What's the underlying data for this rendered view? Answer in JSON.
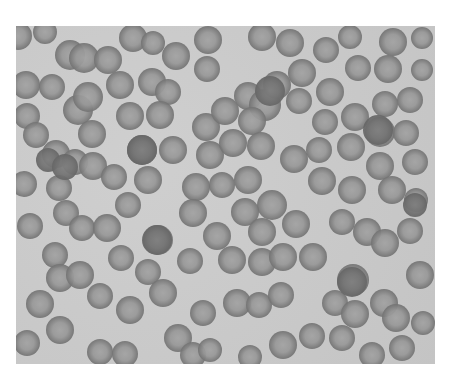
{
  "image": {
    "description": "Light micrograph of a blood smear showing numerous red blood cells (erythrocytes) with pale centers, some overlapping, in grayscale",
    "colors": {
      "background": "#c9c9c9",
      "cell_rim": "#666666",
      "cell_center": "#a3a3a3",
      "page": "#ffffff"
    },
    "bounds": {
      "x": 16,
      "y": 26,
      "width": 419,
      "height": 338
    }
  },
  "cells": [
    {
      "x": 18,
      "y": 36,
      "r": 14
    },
    {
      "x": 45,
      "y": 32,
      "r": 12
    },
    {
      "x": 70,
      "y": 55,
      "r": 15
    },
    {
      "x": 84,
      "y": 58,
      "r": 15
    },
    {
      "x": 108,
      "y": 60,
      "r": 14
    },
    {
      "x": 133,
      "y": 38,
      "r": 14
    },
    {
      "x": 153,
      "y": 43,
      "r": 12
    },
    {
      "x": 176,
      "y": 56,
      "r": 14
    },
    {
      "x": 208,
      "y": 40,
      "r": 14
    },
    {
      "x": 207,
      "y": 69,
      "r": 13
    },
    {
      "x": 262,
      "y": 37,
      "r": 14
    },
    {
      "x": 290,
      "y": 43,
      "r": 14
    },
    {
      "x": 326,
      "y": 50,
      "r": 13
    },
    {
      "x": 350,
      "y": 37,
      "r": 12
    },
    {
      "x": 393,
      "y": 42,
      "r": 14
    },
    {
      "x": 422,
      "y": 38,
      "r": 11
    },
    {
      "x": 26,
      "y": 85,
      "r": 14
    },
    {
      "x": 52,
      "y": 87,
      "r": 13
    },
    {
      "x": 78,
      "y": 110,
      "r": 15
    },
    {
      "x": 88,
      "y": 97,
      "r": 15
    },
    {
      "x": 120,
      "y": 85,
      "r": 14
    },
    {
      "x": 152,
      "y": 82,
      "r": 14
    },
    {
      "x": 168,
      "y": 92,
      "r": 13
    },
    {
      "x": 248,
      "y": 96,
      "r": 14
    },
    {
      "x": 265,
      "y": 105,
      "r": 16
    },
    {
      "x": 277,
      "y": 85,
      "r": 14
    },
    {
      "x": 302,
      "y": 73,
      "r": 14
    },
    {
      "x": 330,
      "y": 92,
      "r": 14
    },
    {
      "x": 358,
      "y": 68,
      "r": 13
    },
    {
      "x": 388,
      "y": 69,
      "r": 14
    },
    {
      "x": 410,
      "y": 100,
      "r": 13
    },
    {
      "x": 422,
      "y": 70,
      "r": 11
    },
    {
      "x": 27,
      "y": 116,
      "r": 13
    },
    {
      "x": 36,
      "y": 135,
      "r": 13
    },
    {
      "x": 92,
      "y": 134,
      "r": 14
    },
    {
      "x": 130,
      "y": 116,
      "r": 14
    },
    {
      "x": 160,
      "y": 115,
      "r": 14
    },
    {
      "x": 206,
      "y": 127,
      "r": 14
    },
    {
      "x": 225,
      "y": 111,
      "r": 14
    },
    {
      "x": 252,
      "y": 121,
      "r": 14
    },
    {
      "x": 299,
      "y": 101,
      "r": 13
    },
    {
      "x": 325,
      "y": 122,
      "r": 13
    },
    {
      "x": 355,
      "y": 117,
      "r": 14
    },
    {
      "x": 385,
      "y": 104,
      "r": 13
    },
    {
      "x": 380,
      "y": 132,
      "r": 15
    },
    {
      "x": 406,
      "y": 133,
      "r": 13
    },
    {
      "x": 56,
      "y": 154,
      "r": 14
    },
    {
      "x": 75,
      "y": 162,
      "r": 13
    },
    {
      "x": 93,
      "y": 166,
      "r": 14
    },
    {
      "x": 142,
      "y": 150,
      "r": 15
    },
    {
      "x": 173,
      "y": 150,
      "r": 14
    },
    {
      "x": 210,
      "y": 155,
      "r": 14
    },
    {
      "x": 233,
      "y": 143,
      "r": 14
    },
    {
      "x": 261,
      "y": 146,
      "r": 14
    },
    {
      "x": 294,
      "y": 159,
      "r": 14
    },
    {
      "x": 319,
      "y": 150,
      "r": 13
    },
    {
      "x": 351,
      "y": 147,
      "r": 14
    },
    {
      "x": 380,
      "y": 166,
      "r": 14
    },
    {
      "x": 415,
      "y": 162,
      "r": 13
    },
    {
      "x": 24,
      "y": 184,
      "r": 13
    },
    {
      "x": 59,
      "y": 188,
      "r": 13
    },
    {
      "x": 114,
      "y": 177,
      "r": 13
    },
    {
      "x": 148,
      "y": 180,
      "r": 14
    },
    {
      "x": 196,
      "y": 187,
      "r": 14
    },
    {
      "x": 222,
      "y": 185,
      "r": 13
    },
    {
      "x": 248,
      "y": 180,
      "r": 14
    },
    {
      "x": 272,
      "y": 205,
      "r": 15
    },
    {
      "x": 322,
      "y": 181,
      "r": 14
    },
    {
      "x": 352,
      "y": 190,
      "r": 14
    },
    {
      "x": 392,
      "y": 190,
      "r": 14
    },
    {
      "x": 416,
      "y": 200,
      "r": 12
    },
    {
      "x": 30,
      "y": 226,
      "r": 13
    },
    {
      "x": 66,
      "y": 213,
      "r": 13
    },
    {
      "x": 82,
      "y": 228,
      "r": 13
    },
    {
      "x": 107,
      "y": 228,
      "r": 14
    },
    {
      "x": 128,
      "y": 205,
      "r": 13
    },
    {
      "x": 158,
      "y": 240,
      "r": 15
    },
    {
      "x": 193,
      "y": 213,
      "r": 14
    },
    {
      "x": 217,
      "y": 236,
      "r": 14
    },
    {
      "x": 245,
      "y": 212,
      "r": 14
    },
    {
      "x": 262,
      "y": 232,
      "r": 14
    },
    {
      "x": 296,
      "y": 224,
      "r": 14
    },
    {
      "x": 342,
      "y": 222,
      "r": 13
    },
    {
      "x": 367,
      "y": 232,
      "r": 14
    },
    {
      "x": 385,
      "y": 243,
      "r": 14
    },
    {
      "x": 410,
      "y": 231,
      "r": 13
    },
    {
      "x": 55,
      "y": 255,
      "r": 13
    },
    {
      "x": 60,
      "y": 278,
      "r": 14
    },
    {
      "x": 80,
      "y": 275,
      "r": 14
    },
    {
      "x": 121,
      "y": 258,
      "r": 13
    },
    {
      "x": 148,
      "y": 272,
      "r": 13
    },
    {
      "x": 190,
      "y": 261,
      "r": 13
    },
    {
      "x": 232,
      "y": 260,
      "r": 14
    },
    {
      "x": 262,
      "y": 262,
      "r": 14
    },
    {
      "x": 283,
      "y": 257,
      "r": 14
    },
    {
      "x": 313,
      "y": 257,
      "r": 14
    },
    {
      "x": 353,
      "y": 280,
      "r": 16
    },
    {
      "x": 420,
      "y": 275,
      "r": 14
    },
    {
      "x": 40,
      "y": 304,
      "r": 14
    },
    {
      "x": 100,
      "y": 296,
      "r": 13
    },
    {
      "x": 130,
      "y": 310,
      "r": 14
    },
    {
      "x": 163,
      "y": 293,
      "r": 14
    },
    {
      "x": 203,
      "y": 313,
      "r": 13
    },
    {
      "x": 237,
      "y": 303,
      "r": 14
    },
    {
      "x": 259,
      "y": 305,
      "r": 13
    },
    {
      "x": 281,
      "y": 295,
      "r": 13
    },
    {
      "x": 335,
      "y": 303,
      "r": 13
    },
    {
      "x": 355,
      "y": 314,
      "r": 14
    },
    {
      "x": 384,
      "y": 303,
      "r": 14
    },
    {
      "x": 396,
      "y": 318,
      "r": 14
    },
    {
      "x": 423,
      "y": 323,
      "r": 12
    },
    {
      "x": 27,
      "y": 343,
      "r": 13
    },
    {
      "x": 60,
      "y": 330,
      "r": 14
    },
    {
      "x": 100,
      "y": 352,
      "r": 13
    },
    {
      "x": 125,
      "y": 354,
      "r": 13
    },
    {
      "x": 178,
      "y": 338,
      "r": 14
    },
    {
      "x": 193,
      "y": 355,
      "r": 13
    },
    {
      "x": 210,
      "y": 350,
      "r": 12
    },
    {
      "x": 250,
      "y": 357,
      "r": 12
    },
    {
      "x": 283,
      "y": 345,
      "r": 14
    },
    {
      "x": 312,
      "y": 336,
      "r": 13
    },
    {
      "x": 342,
      "y": 338,
      "r": 13
    },
    {
      "x": 372,
      "y": 355,
      "r": 13
    },
    {
      "x": 402,
      "y": 348,
      "r": 13
    }
  ],
  "dark_cells": [
    {
      "x": 48,
      "y": 160,
      "r": 12
    },
    {
      "x": 65,
      "y": 167,
      "r": 13
    },
    {
      "x": 142,
      "y": 150,
      "r": 15
    },
    {
      "x": 157,
      "y": 240,
      "r": 15
    },
    {
      "x": 270,
      "y": 91,
      "r": 15
    },
    {
      "x": 378,
      "y": 130,
      "r": 15
    },
    {
      "x": 415,
      "y": 205,
      "r": 12
    },
    {
      "x": 352,
      "y": 282,
      "r": 15
    }
  ]
}
